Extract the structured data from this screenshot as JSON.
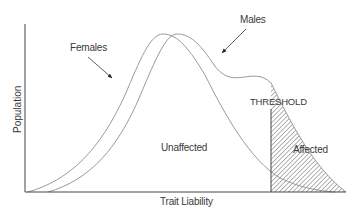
{
  "diagram": {
    "title": "",
    "axes": {
      "y_label": "Population",
      "x_label": "Trait Liability"
    },
    "curves": [
      {
        "name": "Females",
        "label": "Females",
        "peak_x": 163
      },
      {
        "name": "Males",
        "label": "Males",
        "peak_x": 177
      }
    ],
    "threshold": {
      "label": "THRESHOLD"
    },
    "regions": {
      "unaffected": "Unaffected",
      "affected": "Affected"
    },
    "colors": {
      "axis": "#444444",
      "curve": "#9a9a9a",
      "hatch": "#555555",
      "text": "#3a3a3a"
    }
  }
}
